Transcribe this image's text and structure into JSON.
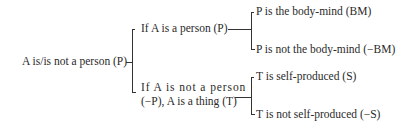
{
  "diagram": {
    "root": "A is/is not a person (P)",
    "branch_person": "If A is a person (P)",
    "branch_thing_line1": "If A is not a person",
    "branch_thing_line2": "(−P), A is a thing (T)",
    "leaf_bm": "P is the body-mind (BM)",
    "leaf_not_bm": "P is not the body-mind (−BM)",
    "leaf_s": "T is self-produced (S)",
    "leaf_not_s": "T is not self-produced (−S)"
  }
}
